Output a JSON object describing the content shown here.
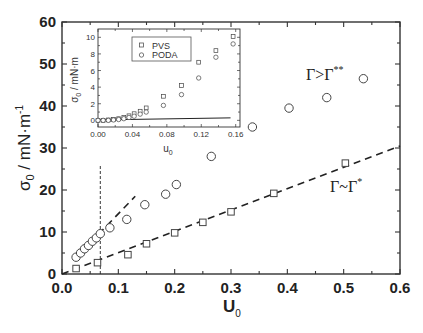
{
  "chart_data": [
    {
      "id": "main",
      "type": "scatter",
      "title": "",
      "xlabel": "U0",
      "ylabel": "σ0 / mN·m⁻¹",
      "xlim": [
        0.0,
        0.6
      ],
      "ylim": [
        0,
        60
      ],
      "xticks": [
        0.0,
        0.1,
        0.2,
        0.3,
        0.4,
        0.5,
        0.6
      ],
      "xtick_labels": [
        "0.0",
        "0.1",
        "0.2",
        "0.3",
        "0.4",
        "0.5",
        "0.6"
      ],
      "yticks": [
        0,
        10,
        20,
        30,
        40,
        50,
        60
      ],
      "ytick_labels": [
        "0",
        "10",
        "20",
        "30",
        "40",
        "50",
        "60"
      ],
      "grid": false,
      "series": [
        {
          "name": "circles",
          "marker": "circle",
          "x": [
            0.025,
            0.033,
            0.04,
            0.047,
            0.054,
            0.061,
            0.068,
            0.085,
            0.115,
            0.147,
            0.184,
            0.203,
            0.265,
            0.338,
            0.403,
            0.47,
            0.535
          ],
          "y": [
            4.0,
            5.0,
            6.0,
            6.8,
            7.8,
            8.6,
            9.6,
            11.0,
            13.0,
            16.5,
            19.0,
            21.3,
            28.0,
            35.0,
            39.5,
            42.0,
            46.5
          ]
        },
        {
          "name": "squares",
          "marker": "square",
          "x": [
            0.025,
            0.063,
            0.117,
            0.15,
            0.2,
            0.25,
            0.3,
            0.376,
            0.503
          ],
          "y": [
            1.3,
            2.7,
            4.6,
            7.2,
            9.8,
            12.3,
            14.8,
            19.2,
            26.4
          ]
        }
      ],
      "lines": [
        {
          "name": "fit-circles",
          "style": "dashed",
          "x": [
            0.065,
            0.13
          ],
          "y": [
            9.5,
            18.5
          ]
        },
        {
          "name": "fit-squares",
          "style": "dashed",
          "x": [
            0.0,
            0.6
          ],
          "y": [
            0.0,
            30.5
          ]
        },
        {
          "name": "vertical-marker",
          "style": "dotted",
          "x": [
            0.068,
            0.068
          ],
          "y": [
            0,
            26
          ]
        }
      ],
      "annotations": [
        {
          "text": "Γ>Γ**",
          "x": 0.46,
          "y": 49
        },
        {
          "text": "Γ~Γ*",
          "x": 0.53,
          "y": 21
        }
      ]
    },
    {
      "id": "inset",
      "type": "scatter",
      "title": "",
      "xlabel": "u0",
      "ylabel": "σ0 / mN·m",
      "xlim": [
        0.0,
        0.165
      ],
      "ylim": [
        -0.8,
        11
      ],
      "xticks": [
        0.0,
        0.04,
        0.08,
        0.12,
        0.16
      ],
      "xtick_labels": [
        "0.00",
        "0.04",
        "0.08",
        "0.12",
        "0.16"
      ],
      "yticks": [
        0,
        2,
        4,
        6,
        8,
        10
      ],
      "ytick_labels": [
        "0",
        "2",
        "4",
        "6",
        "8",
        "10"
      ],
      "legend": {
        "position": "upper-left",
        "entries": [
          "PVS",
          "PODA"
        ]
      },
      "series": [
        {
          "name": "PVS",
          "marker": "square",
          "x": [
            0.0,
            0.006,
            0.012,
            0.018,
            0.024,
            0.03,
            0.036,
            0.042,
            0.049,
            0.056,
            0.076,
            0.097,
            0.117,
            0.137,
            0.157
          ],
          "y": [
            0.0,
            0.0,
            0.05,
            0.1,
            0.2,
            0.35,
            0.55,
            0.8,
            1.1,
            1.5,
            2.9,
            4.2,
            7.0,
            8.4,
            10.1
          ]
        },
        {
          "name": "PODA",
          "marker": "circle",
          "x": [
            0.0,
            0.006,
            0.012,
            0.018,
            0.024,
            0.03,
            0.036,
            0.042,
            0.049,
            0.056,
            0.076,
            0.097,
            0.117,
            0.137,
            0.157
          ],
          "y": [
            0.0,
            0.0,
            0.0,
            0.05,
            0.1,
            0.2,
            0.35,
            0.5,
            0.75,
            1.0,
            1.8,
            3.1,
            5.1,
            7.6,
            9.2
          ]
        }
      ],
      "lines": [
        {
          "name": "reference-line",
          "style": "solid",
          "x": [
            0.0,
            0.154
          ],
          "y": [
            0.05,
            0.3
          ]
        }
      ]
    }
  ],
  "labels": {
    "main_ylabel_sigma": "σ",
    "main_ylabel_sub": "0",
    "main_ylabel_unit": " / mN·m",
    "main_ylabel_sup": "-1",
    "main_xlabel": "U",
    "main_xlabel_sub": "0",
    "inset_ylabel_sigma": "σ",
    "inset_ylabel_sub": "0",
    "inset_ylabel_unit": " / mN·m",
    "inset_xlabel": "u",
    "inset_xlabel_sub": "0",
    "legend_pvs": "PVS",
    "legend_poda": "PODA",
    "annot_high": "Γ>Γ",
    "annot_high_sup": "**",
    "annot_low": "Γ~Γ",
    "annot_low_sup": "*"
  },
  "colors": {
    "axis": "#333333",
    "marker": "#444444",
    "background": "#ffffff"
  }
}
